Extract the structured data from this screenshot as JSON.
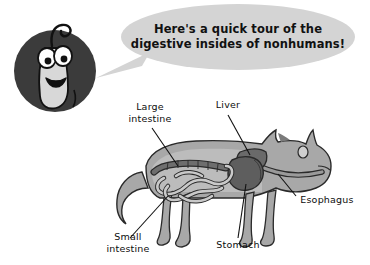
{
  "image": {
    "title": "Digestive insides of nonhumans diagram",
    "background_color": "#ffffff",
    "width": 370,
    "height": 265
  },
  "mascot": {
    "name": "cartoon-sprout-character",
    "badge_color": "#3b3b3b",
    "body_color": "#d8d8d8",
    "outline_color": "#111111",
    "description": "smiling sprout mascot with large eyes in a dark circle"
  },
  "speech_bubble": {
    "fill_color": "#d4d4d4",
    "line1": "Here's a quick tour of the",
    "line2": "digestive insides of nonhumans!"
  },
  "animal": {
    "name": "cat-figure",
    "body_color": "#a8a8a8",
    "body_shade_color": "#bcbcbc",
    "outline_color": "#2a2a2a"
  },
  "organs": [
    {
      "id": "large-intestine",
      "label_line1": "Large",
      "label_line2": "intestine",
      "color": "#6e6e6e"
    },
    {
      "id": "liver",
      "label_line1": "Liver",
      "label_line2": "",
      "color": "#6a6a6a"
    },
    {
      "id": "esophagus",
      "label_line1": "Esophagus",
      "label_line2": "",
      "color": "#9a9a9a"
    },
    {
      "id": "small-intestine",
      "label_line1": "Small",
      "label_line2": "intestine",
      "color": "#c9c9c9"
    },
    {
      "id": "stomach",
      "label_line1": "Stomach",
      "label_line2": "",
      "color": "#5e5e5e"
    }
  ]
}
